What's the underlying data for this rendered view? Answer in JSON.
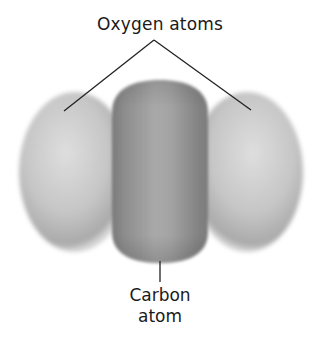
{
  "diagram": {
    "labels": {
      "oxygen": "Oxygen atoms",
      "carbon_line1": "Carbon",
      "carbon_line2": "atom"
    },
    "atoms": [
      {
        "name": "oxygen-left",
        "element": "O"
      },
      {
        "name": "carbon-center",
        "element": "C"
      },
      {
        "name": "oxygen-right",
        "element": "O"
      }
    ],
    "colors": {
      "oxygen_light": "#d8d8d8",
      "oxygen_mid": "#b8b8b8",
      "oxygen_edge": "#a0a0a0",
      "carbon_light": "#a8a8a8",
      "carbon_dark": "#777777",
      "leader_line": "#222222",
      "text": "#1a1a1a"
    }
  }
}
